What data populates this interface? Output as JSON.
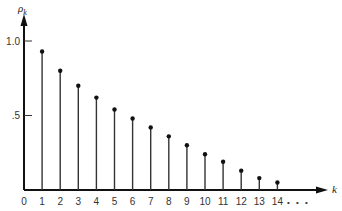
{
  "chart_data": {
    "type": "bar",
    "subtype": "stem",
    "title": "",
    "xlabel": "k",
    "ylabel": "ρ_k",
    "ylabel_display": {
      "base": "ρ",
      "sub": "k"
    },
    "x": [
      1,
      2,
      3,
      4,
      5,
      6,
      7,
      8,
      9,
      10,
      11,
      12,
      13,
      14
    ],
    "categories": [
      "1",
      "2",
      "3",
      "4",
      "5",
      "6",
      "7",
      "8",
      "9",
      "10",
      "11",
      "12",
      "13",
      "14"
    ],
    "values": [
      0.93,
      0.8,
      0.7,
      0.62,
      0.54,
      0.48,
      0.42,
      0.36,
      0.3,
      0.24,
      0.19,
      0.13,
      0.08,
      0.05
    ],
    "x_tick_labels": [
      "0",
      "1",
      "2",
      "3",
      "4",
      "5",
      "6",
      "7",
      "8",
      "9",
      "10",
      "11",
      "12",
      "13",
      "14"
    ],
    "x_continuation": "• • •",
    "y_ticks": [
      {
        "value": 1.0,
        "label": "1.0"
      },
      {
        "value": 0.5,
        "label": ".5"
      }
    ],
    "ylim": [
      0,
      1.0
    ],
    "xlim": [
      0,
      15
    ],
    "grid": false,
    "legend": null
  }
}
